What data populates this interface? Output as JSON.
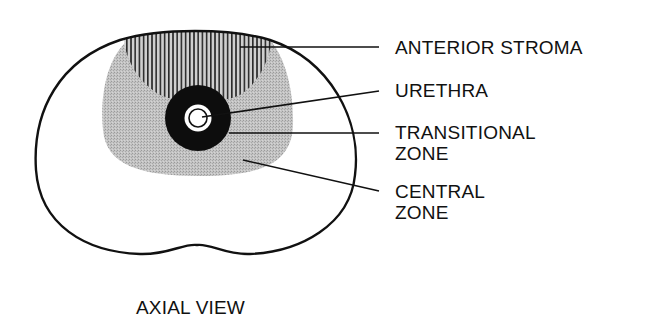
{
  "diagram": {
    "caption": "AXIAL VIEW",
    "labels": [
      {
        "id": "anterior-stroma",
        "lines": [
          "ANTERIOR STROMA"
        ]
      },
      {
        "id": "urethra",
        "lines": [
          "URETHRA"
        ]
      },
      {
        "id": "transitional-zone",
        "lines": [
          "TRANSITIONAL",
          "ZONE"
        ]
      },
      {
        "id": "central-zone",
        "lines": [
          "CENTRAL",
          "ZONE"
        ]
      }
    ],
    "colors": {
      "outline": "#111111",
      "central_zone_fill": "#bdbdbd",
      "transitional_zone_fill": "#0d0d0d",
      "hatch": "#222222",
      "background": "#ffffff"
    }
  }
}
